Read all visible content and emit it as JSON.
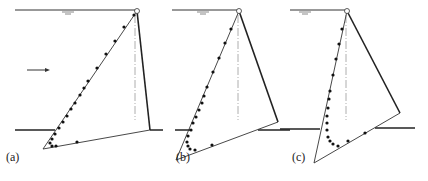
{
  "figure": {
    "panels": [
      {
        "label": "(a)",
        "label_pos": [
          6,
          150
        ],
        "surface": [
          15,
          10,
          135,
          10
        ],
        "water_symbol": [
          68,
          10
        ],
        "pivot": [
          137,
          11
        ],
        "tip": [
          43,
          149
        ],
        "heel": [
          150,
          130
        ],
        "axis": [
          135,
          15,
          135,
          120
        ],
        "ground": [
          [
            15,
            130,
            55,
            130
          ],
          [
            150,
            130,
            163,
            130
          ]
        ],
        "arrow": [
          27,
          70,
          50,
          70
        ],
        "points": [
          [
            134,
            15
          ],
          [
            124,
            27
          ],
          [
            115,
            41
          ],
          [
            106,
            54
          ],
          [
            97,
            68
          ],
          [
            88,
            81
          ],
          [
            84,
            88
          ],
          [
            80,
            95
          ],
          [
            75,
            103
          ],
          [
            71,
            109
          ],
          [
            67,
            116
          ],
          [
            63,
            122
          ],
          [
            59,
            128
          ],
          [
            55,
            134
          ],
          [
            52,
            139
          ],
          [
            50,
            143
          ],
          [
            52,
            146
          ],
          [
            56,
            146
          ],
          [
            77,
            142
          ]
        ]
      },
      {
        "label": "(b)",
        "label_pos": [
          176,
          150
        ],
        "surface": [
          172,
          10,
          238,
          10
        ],
        "water_symbol": [
          203,
          10
        ],
        "pivot": [
          239,
          11
        ],
        "tip": [
          176,
          160
        ],
        "heel": [
          278,
          122
        ],
        "axis": [
          238,
          15,
          238,
          120
        ],
        "ground": [
          [
            175,
            130,
            190,
            130
          ],
          [
            258,
            130,
            290,
            130
          ]
        ],
        "points": [
          [
            231,
            29
          ],
          [
            225,
            43
          ],
          [
            219,
            58
          ],
          [
            213,
            72
          ],
          [
            207,
            87
          ],
          [
            204,
            96
          ],
          [
            202,
            103
          ],
          [
            199,
            110
          ],
          [
            196,
            117
          ],
          [
            193,
            123
          ],
          [
            191,
            130
          ],
          [
            188,
            136
          ],
          [
            187,
            142
          ],
          [
            188,
            146
          ],
          [
            190,
            149
          ],
          [
            195,
            150
          ],
          [
            212,
            145
          ]
        ]
      },
      {
        "label": "(c)",
        "label_pos": [
          292,
          150
        ],
        "surface": [
          290,
          10,
          345,
          10
        ],
        "water_symbol": [
          305,
          10
        ],
        "pivot": [
          347,
          11
        ],
        "tip": [
          314,
          163
        ],
        "heel": [
          400,
          113
        ],
        "axis": [
          346,
          15,
          346,
          120
        ],
        "ground": [
          [
            280,
            129,
            320,
            129
          ],
          [
            375,
            128,
            415,
            128
          ]
        ],
        "points": [
          [
            342,
            29
          ],
          [
            339,
            44
          ],
          [
            336,
            59
          ],
          [
            333,
            75
          ],
          [
            330,
            91
          ],
          [
            329,
            99
          ],
          [
            328,
            108
          ],
          [
            327,
            116
          ],
          [
            327,
            123
          ],
          [
            327,
            130
          ],
          [
            328,
            137
          ],
          [
            330,
            141
          ],
          [
            333,
            144
          ],
          [
            338,
            146
          ],
          [
            348,
            141
          ],
          [
            365,
            133
          ]
        ]
      }
    ]
  }
}
